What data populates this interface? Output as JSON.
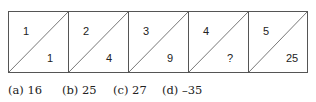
{
  "boxes": [
    {
      "top": "1",
      "bottom": "1"
    },
    {
      "top": "2",
      "bottom": "4"
    },
    {
      "top": "3",
      "bottom": "9"
    },
    {
      "top": "4",
      "bottom": "?"
    },
    {
      "top": "5",
      "bottom": "25"
    }
  ],
  "options": [
    {
      "label": "(a) 16"
    },
    {
      "label": "(b) 25"
    },
    {
      "label": "(c) 27"
    },
    {
      "label": "(d) –35"
    }
  ],
  "colors": {
    "line": "#555555",
    "text": "#222222"
  }
}
